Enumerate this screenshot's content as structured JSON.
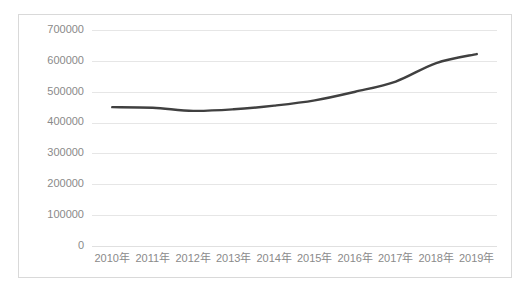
{
  "chart_data": {
    "type": "line",
    "title": "",
    "subtitle": "",
    "xlabel": "",
    "ylabel": "",
    "categories": [
      "2010年",
      "2011年",
      "2012年",
      "2013年",
      "2014年",
      "2015年",
      "2016年",
      "2017年",
      "2018年",
      "2019年"
    ],
    "series": [
      {
        "name": "",
        "color": "#404040",
        "values": [
          450000,
          448000,
          438000,
          443000,
          455000,
          472000,
          500000,
          533000,
          593000,
          622000
        ]
      }
    ],
    "values": [
      450000,
      448000,
      438000,
      443000,
      455000,
      472000,
      500000,
      533000,
      593000,
      622000
    ],
    "ylim": [
      0,
      700000
    ],
    "ytick_values": [
      0,
      100000,
      200000,
      300000,
      400000,
      500000,
      600000,
      700000
    ],
    "ytick_labels": [
      "0",
      "100000",
      "200000",
      "300000",
      "400000",
      "500000",
      "600000",
      "700000"
    ],
    "xtick_labels": [
      "2010年",
      "2011年",
      "2012年",
      "2013年",
      "2014年",
      "2015年",
      "2016年",
      "2017年",
      "2018年",
      "2019年"
    ],
    "grid": true,
    "grid_axis": "y",
    "legend": false,
    "legend_position": "none",
    "annotations": [],
    "colors": {
      "line": "#404040",
      "gridline": "#e6e6e6",
      "tick_text": "#8a8a8a",
      "plot_background": "#ffffff",
      "frame_border": "#d9d9d9"
    }
  }
}
